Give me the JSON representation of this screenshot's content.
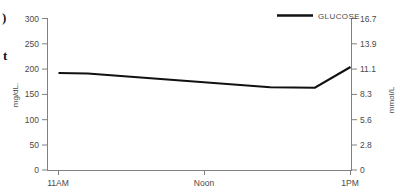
{
  "chart_data": {
    "type": "line",
    "title": "",
    "xlabel": "",
    "ylabel": "mg/dL.",
    "y2label": "mmol/L",
    "grid": false,
    "legend_position": "top-right",
    "series": [
      {
        "name": "GLUCOSE",
        "color": "#111111",
        "x": [
          "11AM",
          "11:10AM",
          "12:30PM",
          "12:50PM",
          "1PM"
        ],
        "values": [
          192,
          191,
          164,
          163,
          204
        ]
      }
    ],
    "categories": [
      "11AM",
      "Noon",
      "1PM"
    ],
    "x_tick_labels": [
      "11AM",
      "Noon",
      "1PM"
    ],
    "ylim": [
      0,
      300
    ],
    "y_tick_labels": [
      "0",
      "50",
      "100",
      "150",
      "200",
      "250",
      "300"
    ],
    "y_tick_values": [
      0,
      50,
      100,
      150,
      200,
      250,
      300
    ],
    "y2lim": [
      0,
      16.7
    ],
    "y2_tick_labels": [
      "0",
      "2.8",
      "5.6",
      "8.3",
      "11.1",
      "13.9",
      "16.7"
    ],
    "y2_tick_values": [
      0,
      2.8,
      5.6,
      8.3,
      11.1,
      13.9,
      16.7
    ]
  },
  "legend": {
    "entries": [
      {
        "label": "GLUCOSE",
        "color": "#111111"
      }
    ]
  },
  "axes": {
    "left_title": "mg/dL.",
    "right_title": "mmol/L",
    "left_ticks": [
      "300",
      "250",
      "200",
      "150",
      "100",
      "50",
      "0"
    ],
    "right_ticks": [
      "16.7",
      "13.9",
      "11.1",
      "8.3",
      "5.6",
      "2.8",
      "0"
    ],
    "x_ticks": [
      "11AM",
      "Noon",
      "1PM"
    ]
  },
  "edge_artifacts": {
    "glyph_top": ")",
    "glyph_bottom": "t"
  },
  "colors": {
    "line": "#111111",
    "axis": "#808080",
    "text": "#4a4a4a",
    "background": "#ffffff"
  }
}
